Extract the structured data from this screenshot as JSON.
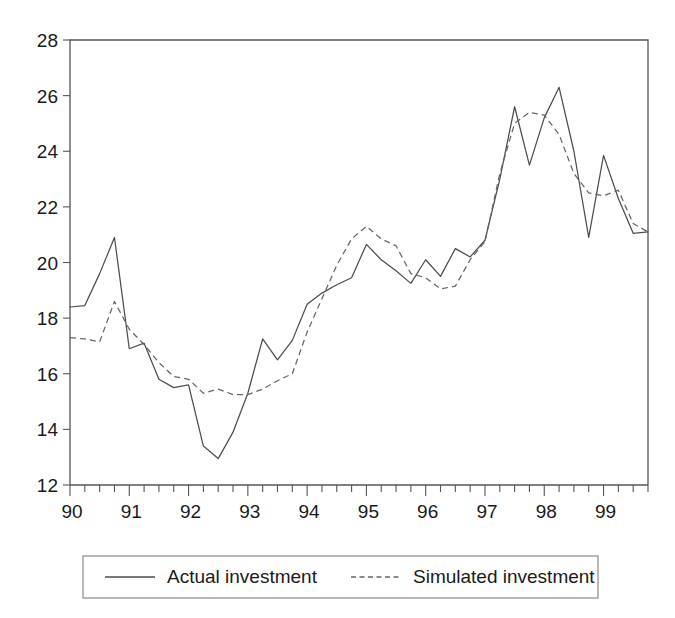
{
  "chart_data": {
    "type": "line",
    "title": "",
    "subtitle": "",
    "xlabel": "",
    "ylabel": "",
    "xlim": [
      1990.0,
      1999.75
    ],
    "ylim": [
      12,
      28
    ],
    "grid": false,
    "legend_position": "bottom",
    "x_tick_labels": [
      "90",
      "91",
      "92",
      "93",
      "94",
      "95",
      "96",
      "97",
      "98",
      "99"
    ],
    "x_tick_values": [
      1990,
      1991,
      1992,
      1993,
      1994,
      1995,
      1996,
      1997,
      1998,
      1999
    ],
    "x_minor_ticks_per_major": 4,
    "y_tick_labels": [
      "12",
      "14",
      "16",
      "18",
      "20",
      "22",
      "24",
      "26",
      "28"
    ],
    "y_tick_values": [
      12,
      14,
      16,
      18,
      20,
      22,
      24,
      26,
      28
    ],
    "x": [
      1990.0,
      1990.25,
      1990.5,
      1990.75,
      1991.0,
      1991.25,
      1991.5,
      1991.75,
      1992.0,
      1992.25,
      1992.5,
      1992.75,
      1993.0,
      1993.25,
      1993.5,
      1993.75,
      1994.0,
      1994.25,
      1994.5,
      1994.75,
      1995.0,
      1995.25,
      1995.5,
      1995.75,
      1996.0,
      1996.25,
      1996.5,
      1996.75,
      1997.0,
      1997.25,
      1997.5,
      1997.75,
      1998.0,
      1998.25,
      1998.5,
      1998.75,
      1999.0,
      1999.25,
      1999.5,
      1999.75
    ],
    "series": [
      {
        "name": "Actual investment",
        "style": "solid",
        "color": "#4d4d4d",
        "values": [
          18.4,
          18.45,
          19.6,
          20.9,
          16.9,
          17.1,
          15.8,
          15.5,
          15.6,
          13.4,
          12.95,
          13.9,
          15.3,
          17.25,
          16.5,
          17.2,
          18.5,
          18.9,
          19.2,
          19.45,
          20.65,
          20.1,
          19.7,
          19.25,
          20.1,
          19.5,
          20.5,
          20.2,
          20.8,
          23.0,
          25.6,
          23.5,
          25.2,
          26.3,
          24.0,
          20.9,
          23.85,
          22.3,
          21.05,
          21.1
        ]
      },
      {
        "name": "Simulated investment",
        "style": "dashed",
        "color": "#666666",
        "values": [
          17.3,
          17.25,
          17.15,
          18.6,
          17.6,
          17.05,
          16.4,
          15.9,
          15.8,
          15.3,
          15.45,
          15.25,
          15.25,
          15.45,
          15.75,
          16.0,
          17.5,
          18.7,
          19.9,
          20.85,
          21.3,
          20.85,
          20.6,
          19.6,
          19.45,
          19.05,
          19.15,
          20.1,
          20.75,
          23.2,
          25.0,
          25.4,
          25.3,
          24.6,
          23.2,
          22.5,
          22.4,
          22.6,
          21.4,
          21.1
        ]
      }
    ]
  },
  "legend": {
    "items": [
      {
        "label": "Actual investment",
        "style": "solid"
      },
      {
        "label": "Simulated investment",
        "style": "dashed"
      }
    ]
  }
}
